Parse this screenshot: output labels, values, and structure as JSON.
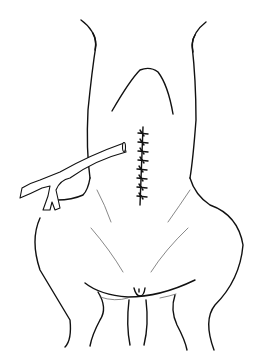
{
  "figure": {
    "colors": {
      "line": "#111111",
      "background": "#ffffff",
      "hair": "#555555"
    },
    "suture_stitches": 8
  }
}
